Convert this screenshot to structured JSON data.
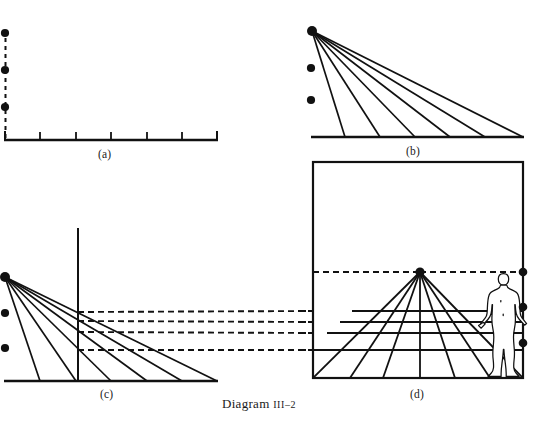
{
  "figure": {
    "caption_text": "Diagram",
    "caption_numeral": "III–2",
    "colors": {
      "ink": "#111111",
      "background": "#ffffff"
    },
    "panels": [
      {
        "id": "a",
        "label": "(a)",
        "description": "Ground line with six measure points and a vertical dashed line carrying three station dots",
        "baseline": {
          "x1": 5,
          "y1": 140,
          "x2": 217,
          "y2": 140
        },
        "ticks_x": [
          5,
          40,
          76,
          111,
          147,
          182,
          217
        ],
        "tick_height": 8,
        "dashed_vertical": {
          "x": 5,
          "y1": 30,
          "y2": 140
        },
        "dots": [
          {
            "x": 5,
            "y": 33
          },
          {
            "x": 5,
            "y": 70
          },
          {
            "x": 5,
            "y": 107
          }
        ]
      },
      {
        "id": "b",
        "label": "(b)",
        "description": "Rays drawn from the vanishing point to each measure point on the ground line",
        "vanishing_point": {
          "x": 312,
          "y": 31
        },
        "baseline": {
          "x1": 312,
          "y1": 137,
          "x2": 523,
          "y2": 137
        },
        "ray_endpoints_x": [
          345,
          380,
          415,
          450,
          485,
          523
        ],
        "dots": [
          {
            "x": 311,
            "y": 68
          },
          {
            "x": 311,
            "y": 100
          }
        ]
      },
      {
        "id": "c",
        "label": "(c)",
        "description": "Picture plane set as a vertical line; intersections of the rays are carried across with dashed transfer lines",
        "vanishing_point": {
          "x": 5,
          "y": 277
        },
        "baseline": {
          "x1": 5,
          "y1": 381,
          "x2": 217,
          "y2": 381
        },
        "ray_endpoints_x": [
          40,
          76,
          111,
          147,
          182,
          217
        ],
        "picture_plane": {
          "x": 78,
          "y1": 228,
          "y2": 381
        },
        "dashed_transfer_y": [
          312,
          321,
          332,
          350
        ],
        "dots": [
          {
            "x": 5,
            "y": 277
          },
          {
            "x": 5,
            "y": 313
          },
          {
            "x": 5,
            "y": 348
          }
        ]
      },
      {
        "id": "d",
        "label": "(d)",
        "description": "Finished perspective grid inside the picture frame with a standing human figure for scale",
        "frame": {
          "x": 313,
          "y": 162,
          "width": 210,
          "height": 216
        },
        "vanishing_point": {
          "x": 420,
          "y": 272
        },
        "horizon_y": 272,
        "ground_y": 378,
        "orthogonal_endpoints_x": [
          313,
          350,
          383,
          420,
          455,
          490,
          523
        ],
        "transversal_y": [
          272,
          311,
          322,
          333,
          350,
          378
        ],
        "dots": [
          {
            "x": 523,
            "y": 272
          },
          {
            "x": 523,
            "y": 307
          },
          {
            "x": 523,
            "y": 343
          }
        ],
        "figure_scale": {
          "name": "standing-human-figure",
          "head_top_y": 272,
          "feet_y": 378,
          "x_center": 503
        }
      }
    ]
  }
}
